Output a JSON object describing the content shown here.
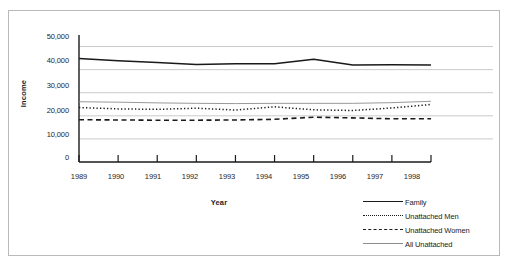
{
  "chart_data": {
    "type": "line",
    "title": "",
    "xlabel": "Year",
    "ylabel": "Income",
    "x": [
      1989,
      1990,
      1991,
      1992,
      1993,
      1994,
      1995,
      1996,
      1997,
      1998
    ],
    "xtick_labels": [
      "1989",
      "1990",
      "1991",
      "1992",
      "1993",
      "1994",
      "1995",
      "1996",
      "1997",
      "1998"
    ],
    "ytick_labels": [
      "0",
      "10,000",
      "20,000",
      "30,000",
      "40,000",
      "50,000"
    ],
    "ytick_values": [
      0,
      10000,
      20000,
      30000,
      40000,
      50000
    ],
    "ylim": [
      0,
      55000
    ],
    "xlim": [
      1989,
      1998
    ],
    "grid": true,
    "grid_axis": "y",
    "legend_position": "bottom-right",
    "series": [
      {
        "name": "Family",
        "style": "solid",
        "color": "#1a1a1a",
        "values": [
          44800,
          43900,
          43100,
          42200,
          42600,
          42500,
          44500,
          42000,
          42100,
          42000
        ]
      },
      {
        "name": "Unattached Men",
        "style": "dotted",
        "color": "#1a1a1a",
        "values": [
          23600,
          23000,
          22800,
          23300,
          22500,
          23900,
          22600,
          22300,
          23400,
          24900
        ]
      },
      {
        "name": "Unattached Women",
        "style": "dashed",
        "color": "#1a1a1a",
        "values": [
          18300,
          18200,
          18100,
          18100,
          18200,
          18500,
          19400,
          19100,
          18700,
          18700
        ]
      },
      {
        "name": "All Unattached",
        "style": "thin-solid",
        "color": "#8d8d8d",
        "values": [
          26100,
          25900,
          25600,
          25400,
          25300,
          25400,
          25400,
          25400,
          25700,
          26300
        ]
      }
    ]
  },
  "legend": {
    "items": [
      {
        "label": "Family",
        "swatch": "solid-line-swatch"
      },
      {
        "label": "Unattached Men",
        "swatch": "dotted-line-swatch"
      },
      {
        "label": "Unattached Women",
        "swatch": "dashed-line-swatch"
      },
      {
        "label": "All Unattached",
        "swatch": "thin-line-swatch"
      }
    ]
  }
}
